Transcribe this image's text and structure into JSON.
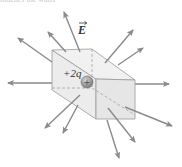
{
  "caption_fragment": "touches the walls",
  "figure": {
    "field_label": "E",
    "charge_label": "+2q",
    "charge_symbol": "+",
    "colors": {
      "arrow": "#8a8a8a",
      "box_edge": "#9a9a9a",
      "box_face_left": "#ececec",
      "box_face_top": "#f1f1f1",
      "box_face_front": "#e6e6e6",
      "charge_fill": "#9c9c9c",
      "text": "#333333"
    },
    "box": {
      "back_top_left": [
        52,
        50
      ],
      "back_top_right": [
        92,
        49
      ],
      "front_top_left": [
        96,
        79
      ],
      "front_top_right": [
        135,
        80
      ],
      "back_bottom_left": [
        52,
        90
      ],
      "front_bottom_left": [
        96,
        119
      ],
      "front_bottom_right": [
        135,
        119
      ]
    },
    "charge": {
      "cx": 87,
      "cy": 82,
      "r": 6
    },
    "arrows": [
      {
        "name": "field-arrow-up-left-labeled",
        "from": [
          80,
          52
        ],
        "to": [
          64,
          12
        ]
      },
      {
        "name": "field-arrow-upper-left",
        "from": [
          66,
          52
        ],
        "to": [
          48,
          32
        ]
      },
      {
        "name": "field-arrow-left-diagonal",
        "from": [
          52,
          62
        ],
        "to": [
          18,
          38
        ]
      },
      {
        "name": "field-arrow-left",
        "from": [
          72,
          83
        ],
        "to": [
          8,
          83
        ]
      },
      {
        "name": "field-arrow-upper-right",
        "from": [
          105,
          63
        ],
        "to": [
          133,
          30
        ]
      },
      {
        "name": "field-arrow-right-upper",
        "from": [
          118,
          65
        ],
        "to": [
          143,
          48
        ]
      },
      {
        "name": "field-arrow-right",
        "from": [
          135,
          84
        ],
        "to": [
          169,
          84
        ]
      },
      {
        "name": "field-arrow-lower-right",
        "from": [
          125,
          107
        ],
        "to": [
          172,
          126
        ]
      },
      {
        "name": "field-arrow-down-right",
        "from": [
          108,
          108
        ],
        "to": [
          135,
          142
        ]
      },
      {
        "name": "field-arrow-down",
        "from": [
          107,
          120
        ],
        "to": [
          119,
          158
        ]
      },
      {
        "name": "field-arrow-down-left",
        "from": [
          80,
          95
        ],
        "to": [
          45,
          128
        ]
      },
      {
        "name": "field-arrow-down-left-2",
        "from": [
          78,
          105
        ],
        "to": [
          63,
          133
        ]
      }
    ]
  }
}
